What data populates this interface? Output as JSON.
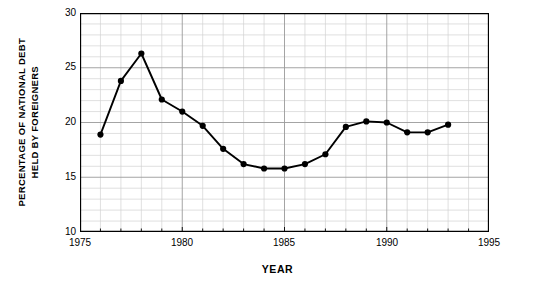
{
  "chart_data": {
    "type": "line",
    "title": "",
    "xlabel": "YEAR",
    "ylabel": "PERCENTAGE OF NATIONAL DEBT HELD BY FOREIGNERS",
    "ylabel_line1": "PERCENTAGE OF NATIONAL DEBT",
    "ylabel_line2": "HELD BY FOREIGNERS",
    "xlim": [
      1975,
      1995
    ],
    "ylim": [
      10,
      30
    ],
    "x_major_ticks": [
      1975,
      1980,
      1985,
      1990,
      1995
    ],
    "x_tick_labels": [
      "1975",
      "1980",
      "1985",
      "1990",
      "1995"
    ],
    "y_major_ticks": [
      10,
      15,
      20,
      25,
      30
    ],
    "y_tick_labels": [
      "10",
      "15",
      "20",
      "25",
      "30"
    ],
    "x_minor_step": 1,
    "y_minor_step": 1,
    "grid": true,
    "grid_minor": true,
    "legend": "none",
    "marker": "filled-circle",
    "line_color": "#000000",
    "grid_color": "#a8a8a8",
    "grid_minor_color": "#d0d0d0",
    "axis_color": "#000000",
    "x": [
      1976,
      1977,
      1978,
      1979,
      1980,
      1981,
      1982,
      1983,
      1984,
      1985,
      1986,
      1987,
      1988,
      1989,
      1990,
      1991,
      1992,
      1993
    ],
    "values": [
      18.9,
      23.8,
      26.3,
      22.1,
      21.0,
      19.7,
      17.6,
      16.2,
      15.8,
      15.8,
      16.2,
      17.1,
      19.6,
      20.1,
      20.0,
      19.1,
      19.1,
      19.8
    ],
    "series": [
      {
        "name": "Percentage of national debt held by foreigners",
        "values": [
          18.9,
          23.8,
          26.3,
          22.1,
          21.0,
          19.7,
          17.6,
          16.2,
          15.8,
          15.8,
          16.2,
          17.1,
          19.6,
          20.1,
          20.0,
          19.1,
          19.1,
          19.8
        ]
      }
    ]
  }
}
